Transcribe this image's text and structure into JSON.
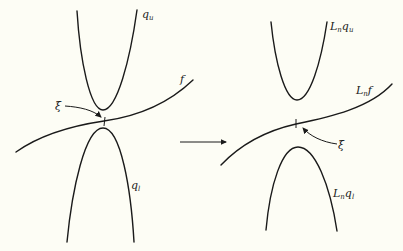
{
  "figure": {
    "left_panel": {
      "upper_curve_label": "q",
      "upper_curve_sub": "u",
      "middle_curve_label": "f",
      "lower_curve_label": "q",
      "lower_curve_sub": "l",
      "point_label": "ξ"
    },
    "right_panel": {
      "upper_curve_label": "L",
      "upper_curve_sub": "n",
      "upper_curve_label2": "q",
      "upper_curve_sub2": "u",
      "middle_curve_label": "L",
      "middle_curve_sub": "n",
      "middle_curve_label2": "f",
      "lower_curve_label": "L",
      "lower_curve_sub": "n",
      "lower_curve_label2": "q",
      "lower_curve_sub2": "l",
      "point_label": "ξ"
    },
    "transition_arrow": "right-arrow",
    "colors": {
      "ink": "#1a1a1a",
      "background": "#fdfdf5"
    }
  }
}
